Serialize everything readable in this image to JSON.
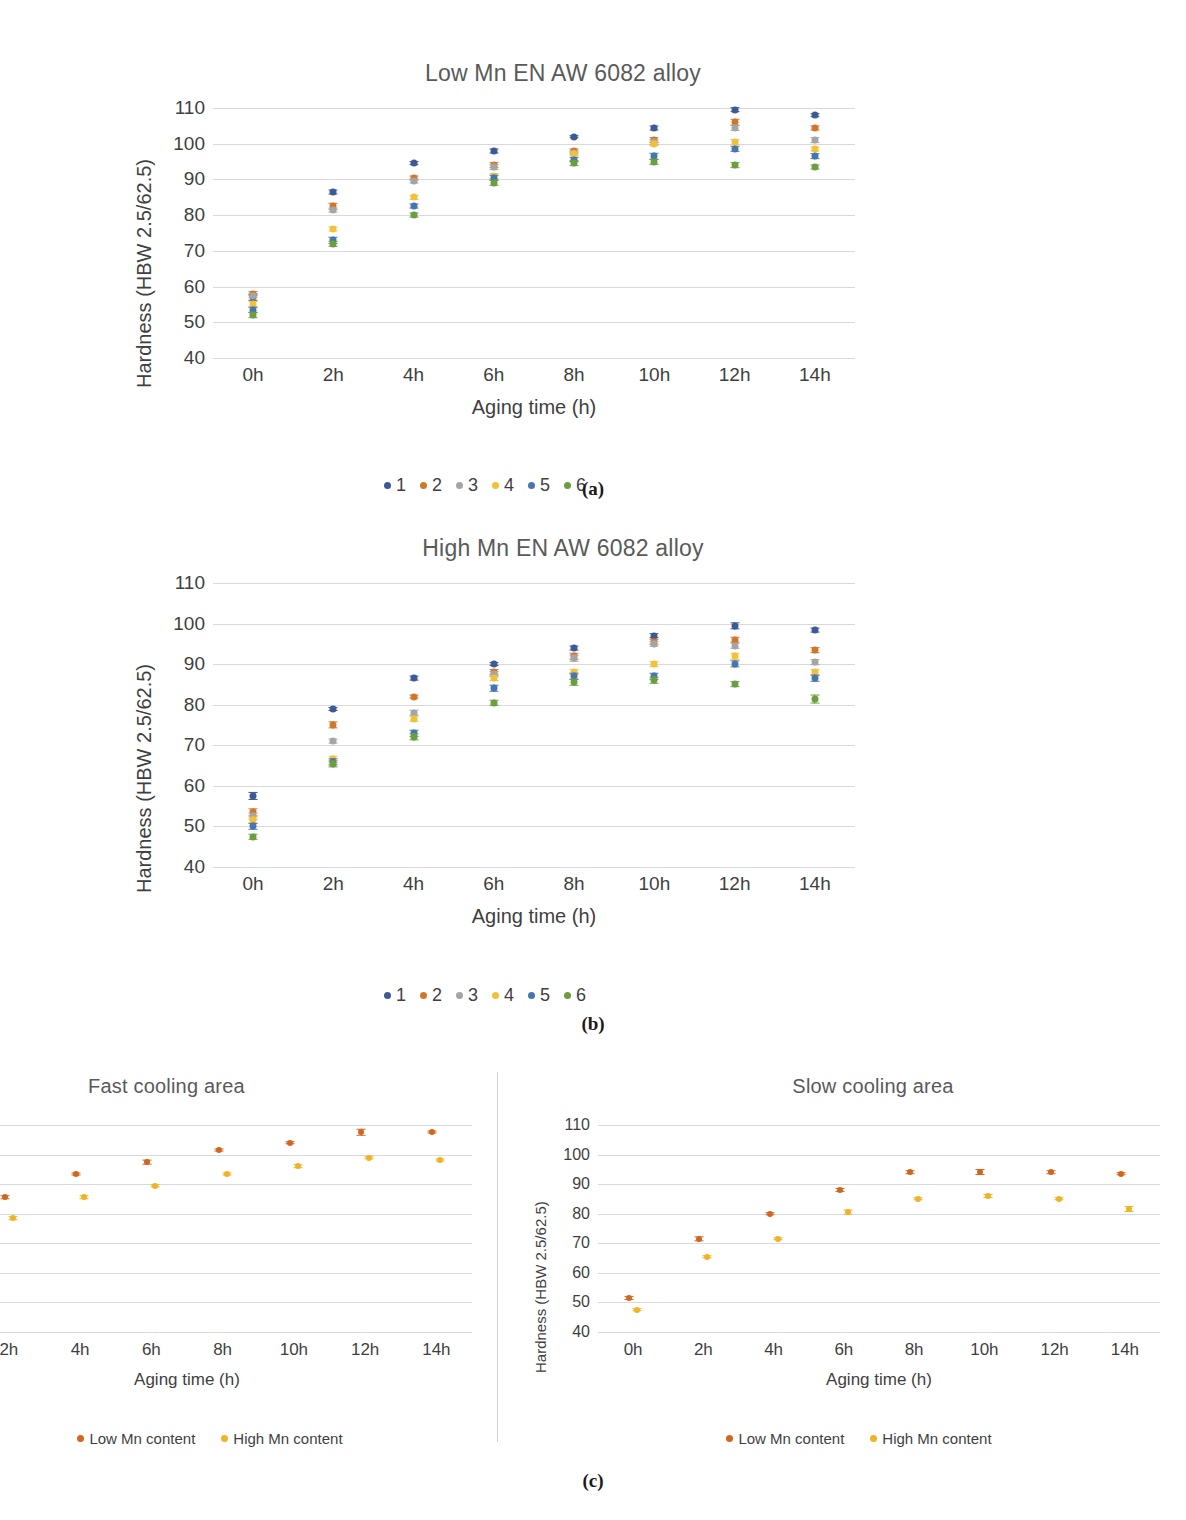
{
  "figure": {
    "panel_labels": [
      "(a)",
      "(b)",
      "(c)"
    ],
    "colors": {
      "s1": "#3d5a96",
      "s2": "#d2762a",
      "s3": "#a5a5a5",
      "s4": "#f2c139",
      "s5": "#4775b0",
      "s6": "#6b9e3f",
      "low_mn": "#d2661f",
      "high_mn": "#f0b323",
      "gridline": "#d9d9d9",
      "text": "#3f3f3f",
      "title": "#5a5a5a"
    }
  },
  "chart_data": [
    {
      "id": "low-mn",
      "type": "scatter",
      "title": "Low Mn EN AW 6082 alloy",
      "xlabel": "Aging time (h)",
      "ylabel": "Hardness (HBW 2.5/62.5)",
      "categories": [
        "0h",
        "2h",
        "4h",
        "6h",
        "8h",
        "10h",
        "12h",
        "14h"
      ],
      "yticks": [
        40,
        50,
        60,
        70,
        80,
        90,
        100,
        110
      ],
      "ylim": [
        40,
        110
      ],
      "grid": true,
      "legend_position": "bottom",
      "legend": [
        "1",
        "2",
        "3",
        "4",
        "5",
        "6"
      ],
      "series": [
        {
          "name": "1",
          "color": "#3d5a96",
          "values": [
            57.0,
            86.5,
            94.5,
            98.0,
            102.0,
            104.5,
            109.5,
            108.0
          ],
          "errors": [
            0.9,
            0.7,
            0.5,
            0.7,
            0.5,
            0.7,
            0.8,
            0.5
          ]
        },
        {
          "name": "2",
          "color": "#d2762a",
          "values": [
            58.0,
            82.5,
            90.5,
            94.0,
            98.0,
            101.0,
            106.0,
            104.5
          ],
          "errors": [
            0.8,
            0.9,
            0.7,
            0.8,
            0.7,
            0.8,
            0.9,
            0.7
          ]
        },
        {
          "name": "3",
          "color": "#a5a5a5",
          "values": [
            57.5,
            81.5,
            89.5,
            93.5,
            97.5,
            100.5,
            104.5,
            101.0
          ],
          "errors": [
            0.8,
            0.7,
            0.7,
            0.8,
            0.7,
            0.8,
            0.9,
            0.8
          ]
        },
        {
          "name": "4",
          "color": "#f2c139",
          "values": [
            55.0,
            76.0,
            85.0,
            91.0,
            97.0,
            100.0,
            100.5,
            98.5
          ],
          "errors": [
            0.8,
            0.7,
            0.6,
            0.8,
            0.7,
            0.8,
            0.8,
            0.7
          ]
        },
        {
          "name": "5",
          "color": "#4775b0",
          "values": [
            53.5,
            73.0,
            82.5,
            90.5,
            95.5,
            96.5,
            98.5,
            96.5
          ],
          "errors": [
            0.9,
            0.9,
            0.7,
            0.9,
            0.8,
            0.9,
            0.9,
            0.8
          ]
        },
        {
          "name": "6",
          "color": "#6b9e3f",
          "values": [
            52.0,
            72.0,
            80.0,
            89.0,
            94.5,
            95.0,
            94.0,
            93.5
          ],
          "errors": [
            0.8,
            0.9,
            0.7,
            0.9,
            0.8,
            0.9,
            0.8,
            0.7
          ]
        }
      ]
    },
    {
      "id": "high-mn",
      "type": "scatter",
      "title": "High Mn EN AW 6082 alloy",
      "xlabel": "Aging time (h)",
      "ylabel": "Hardness (HBW 2.5/62.5)",
      "categories": [
        "0h",
        "2h",
        "4h",
        "6h",
        "8h",
        "10h",
        "12h",
        "14h"
      ],
      "yticks": [
        40,
        50,
        60,
        70,
        80,
        90,
        100,
        110
      ],
      "ylim": [
        40,
        110
      ],
      "grid": true,
      "legend_position": "bottom",
      "legend": [
        "1",
        "2",
        "3",
        "4",
        "5",
        "6"
      ],
      "series": [
        {
          "name": "1",
          "color": "#3d5a96",
          "values": [
            57.5,
            79.0,
            86.5,
            90.0,
            94.0,
            97.0,
            99.5,
            98.5
          ],
          "errors": [
            1.0,
            0.5,
            0.6,
            0.5,
            0.6,
            0.7,
            0.9,
            0.6
          ]
        },
        {
          "name": "2",
          "color": "#d2762a",
          "values": [
            53.5,
            75.0,
            82.0,
            88.0,
            92.0,
            95.5,
            96.0,
            93.5
          ],
          "errors": [
            0.9,
            0.9,
            0.6,
            0.7,
            0.8,
            0.8,
            0.8,
            0.7
          ]
        },
        {
          "name": "3",
          "color": "#a5a5a5",
          "values": [
            52.5,
            71.0,
            78.0,
            87.5,
            91.5,
            95.0,
            94.5,
            90.5
          ],
          "errors": [
            0.8,
            0.6,
            0.8,
            0.7,
            0.8,
            0.8,
            0.8,
            0.7
          ]
        },
        {
          "name": "4",
          "color": "#f2c139",
          "values": [
            51.5,
            66.5,
            76.5,
            86.5,
            88.0,
            90.0,
            92.0,
            88.0
          ],
          "errors": [
            0.8,
            0.8,
            0.8,
            0.7,
            0.7,
            0.7,
            0.8,
            0.7
          ]
        },
        {
          "name": "5",
          "color": "#4775b0",
          "values": [
            50.0,
            66.0,
            73.0,
            84.0,
            87.0,
            87.0,
            90.0,
            86.5
          ],
          "errors": [
            0.8,
            0.9,
            0.8,
            0.8,
            0.8,
            0.8,
            0.9,
            0.8
          ]
        },
        {
          "name": "6",
          "color": "#6b9e3f",
          "values": [
            47.5,
            65.5,
            72.0,
            80.5,
            85.5,
            86.0,
            85.0,
            81.5
          ],
          "errors": [
            0.8,
            0.9,
            0.9,
            0.8,
            0.8,
            0.8,
            0.7,
            1.1
          ]
        }
      ]
    },
    {
      "id": "fast-cooling",
      "type": "scatter",
      "title": "Fast cooling area",
      "xlabel": "Aging time (h)",
      "ylabel": "Hardness (HBW 2.5/62.5)",
      "categories": [
        "0h",
        "2h",
        "4h",
        "6h",
        "8h",
        "10h",
        "12h",
        "14h"
      ],
      "visible_categories": [
        "2h",
        "4h",
        "6h",
        "8h",
        "10h",
        "12h",
        "14h"
      ],
      "yticks": [
        40,
        50,
        60,
        70,
        80,
        90,
        100,
        110
      ],
      "ylim": [
        40,
        110
      ],
      "grid": true,
      "cropped": true,
      "legend_position": "bottom",
      "legend": [
        "Low Mn content",
        "High Mn content"
      ],
      "series": [
        {
          "name": "Low Mn content",
          "color": "#d2661f",
          "values": [
            null,
            85.5,
            93.5,
            97.5,
            101.5,
            104.0,
            107.5,
            107.5
          ],
          "errors": [
            null,
            0.6,
            0.5,
            0.8,
            0.5,
            0.6,
            1.1,
            0.5
          ]
        },
        {
          "name": "High Mn content",
          "color": "#f0b323",
          "values": [
            null,
            78.5,
            85.5,
            89.5,
            93.5,
            96.0,
            99.0,
            98.0
          ],
          "errors": [
            null,
            0.6,
            0.6,
            0.6,
            0.5,
            0.6,
            0.6,
            0.5
          ]
        }
      ]
    },
    {
      "id": "slow-cooling",
      "type": "scatter",
      "title": "Slow cooling area",
      "xlabel": "Aging time (h)",
      "ylabel": "Hardness (HBW 2.5/62.5)",
      "categories": [
        "0h",
        "2h",
        "4h",
        "6h",
        "8h",
        "10h",
        "12h",
        "14h"
      ],
      "yticks": [
        40,
        50,
        60,
        70,
        80,
        90,
        100,
        110
      ],
      "ylim": [
        40,
        110
      ],
      "grid": true,
      "legend_position": "bottom",
      "legend": [
        "Low Mn content",
        "High Mn content"
      ],
      "series": [
        {
          "name": "Low Mn content",
          "color": "#d2661f",
          "values": [
            51.5,
            71.5,
            80.0,
            88.0,
            94.0,
            94.0,
            94.0,
            93.5
          ],
          "errors": [
            0.7,
            0.9,
            0.6,
            0.7,
            0.6,
            1.0,
            0.6,
            0.6
          ]
        },
        {
          "name": "High Mn content",
          "color": "#f0b323",
          "values": [
            47.5,
            65.5,
            71.5,
            80.5,
            85.0,
            86.0,
            85.0,
            81.5
          ],
          "errors": [
            0.6,
            0.6,
            0.6,
            0.8,
            0.6,
            0.7,
            0.6,
            1.0
          ]
        }
      ]
    }
  ]
}
